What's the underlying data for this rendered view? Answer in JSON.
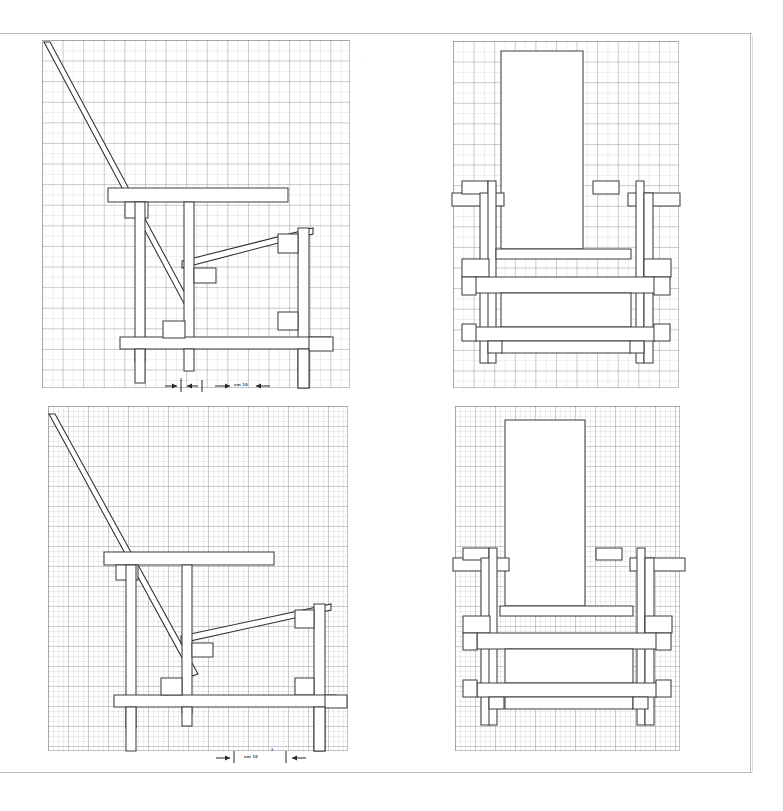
{
  "sheet": {
    "title": "Chair orthographic drawing sheet",
    "background_color": "#ffffff",
    "frame_color": "#b9b9b9",
    "line_color": "#3d3d42",
    "grid_color": "#787d87",
    "width_px": 783,
    "height_px": 811
  },
  "panels": [
    {
      "id": "top-left",
      "name": "side-elevation-coarse-grid",
      "view": "side elevation",
      "grid": "coarse",
      "grid_cells_x": 15,
      "grid_cells_y": 17,
      "x": 42,
      "y": 40,
      "w": 308,
      "h": 348
    },
    {
      "id": "top-right",
      "name": "front-elevation-coarse-grid",
      "view": "front elevation",
      "grid": "coarse",
      "grid_cells_x": 13,
      "grid_cells_y": 17,
      "x": 453,
      "y": 41,
      "w": 226,
      "h": 347
    },
    {
      "id": "bottom-left",
      "name": "side-elevation-fine-grid",
      "view": "side elevation",
      "grid": "fine",
      "grid_cells_x": 15,
      "grid_cells_y": 16,
      "x": 48,
      "y": 406,
      "w": 300,
      "h": 345
    },
    {
      "id": "bottom-right",
      "name": "front-elevation-fine-grid",
      "view": "front elevation",
      "grid": "fine",
      "grid_cells_x": 11,
      "grid_cells_y": 16,
      "x": 455,
      "y": 406,
      "w": 225,
      "h": 345
    }
  ],
  "scale_bars": [
    {
      "id": "scale-top",
      "name": "scale-bar-top-left",
      "unit_label": "cm 10",
      "small_tick_label": "1",
      "x": 160,
      "y": 378,
      "w": 110
    },
    {
      "id": "scale-bottom",
      "name": "scale-bar-bottom-left",
      "unit_label": "cm 10",
      "small_tick_label": "1",
      "x": 212,
      "y": 748,
      "w": 95
    }
  ],
  "legend": {
    "unit": "cm",
    "scale_value": "10"
  }
}
